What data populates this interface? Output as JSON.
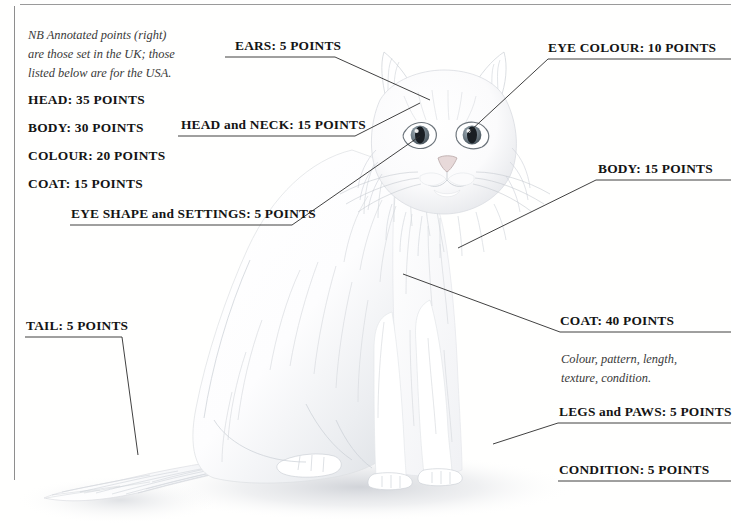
{
  "note": {
    "text": "NB Annotated points (right)\nare those set in the UK; those\nlisted below are for the USA."
  },
  "usa_list": {
    "items": [
      "HEAD: 35 POINTS",
      "BODY: 30 POINTS",
      "COLOUR: 20 POINTS",
      "COAT: 15 POINTS"
    ]
  },
  "annotations": [
    {
      "id": "ears",
      "label": "EARS: 5 POINTS"
    },
    {
      "id": "eye-colour",
      "label": "EYE COLOUR: 10 POINTS"
    },
    {
      "id": "head-neck",
      "label": "HEAD and NECK: 15 POINTS"
    },
    {
      "id": "body",
      "label": "BODY: 15 POINTS"
    },
    {
      "id": "eye-shape",
      "label": "EYE SHAPE and SETTINGS: 5 POINTS"
    },
    {
      "id": "coat",
      "label": "COAT: 40 POINTS"
    },
    {
      "id": "tail",
      "label": "TAIL: 5 POINTS"
    },
    {
      "id": "legs-paws",
      "label": "LEGS and PAWS: 5 POINTS"
    },
    {
      "id": "condition",
      "label": "CONDITION: 5 POINTS"
    }
  ],
  "coat_detail": {
    "text": "Colour, pattern, length,\ntexture, condition."
  },
  "colors": {
    "rule": "#9a9a9a",
    "leader": "#2b2b2b",
    "text": "#171717",
    "note_text": "#3a3a3a",
    "background": "#ffffff",
    "fur_shadow": "#d8dade",
    "eye_iris": "#6f7d86",
    "eye_pupil": "#1a1f24"
  }
}
